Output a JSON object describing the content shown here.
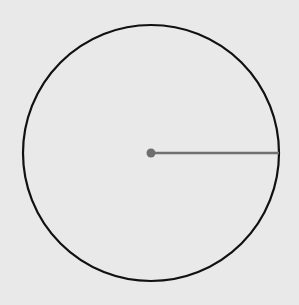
{
  "diagram": {
    "type": "circle-with-radius",
    "background": "#e9e9e9",
    "circle": {
      "cx": 151,
      "cy": 153,
      "r": 128,
      "stroke": "#111111",
      "stroke_width": 2.2
    },
    "radius_line": {
      "x1": 151,
      "y1": 153,
      "x2": 279,
      "y2": 153,
      "stroke": "#707070",
      "stroke_width": 2.5
    },
    "center_point": {
      "cx": 151,
      "cy": 153,
      "r": 4.5,
      "fill": "#6e6e6e"
    }
  }
}
